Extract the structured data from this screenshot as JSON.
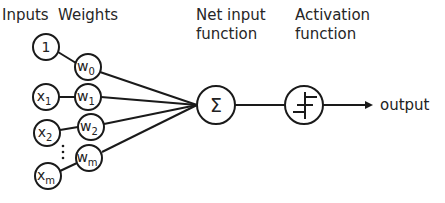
{
  "headers": {
    "inputs": "Inputs",
    "weights": "Weights",
    "net_input": [
      "Net input",
      "function"
    ],
    "activation": [
      "Activation",
      "function"
    ]
  },
  "inputs": [
    {
      "base": "1",
      "sub": ""
    },
    {
      "base": "x",
      "sub": "1"
    },
    {
      "base": "x",
      "sub": "2"
    },
    {
      "base": "x",
      "sub": "m"
    }
  ],
  "weights": [
    {
      "base": "w",
      "sub": "0"
    },
    {
      "base": "w",
      "sub": "1"
    },
    {
      "base": "w",
      "sub": "2"
    },
    {
      "base": "w",
      "sub": "m"
    }
  ],
  "ellipsis": "⋮",
  "sum_symbol": "Σ",
  "output_label": "output",
  "colors": {
    "stroke": "#1a1a1a",
    "background": "#ffffff",
    "text": "#262626"
  }
}
